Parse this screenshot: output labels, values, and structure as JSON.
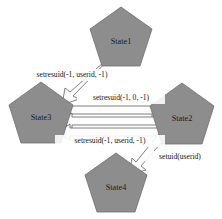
{
  "diagram": {
    "type": "state-machine",
    "canvas": {
      "width": 222,
      "height": 219
    },
    "colors": {
      "node_fill": "#8d8d8d",
      "node_stroke": "#6f6f6f",
      "arrow_fill": "#fdfdfd",
      "arrow_stroke": "#5e5e5e",
      "label_text": "#121212",
      "background": "#ffffff"
    },
    "nodes": [
      {
        "id": "state1",
        "label": "State1",
        "shape": "pentagon",
        "cx": 121,
        "cy": 40,
        "r": 33
      },
      {
        "id": "state3",
        "label": "State3",
        "shape": "pentagon",
        "cx": 41,
        "cy": 116,
        "r": 34
      },
      {
        "id": "state2",
        "label": "State2",
        "shape": "pentagon",
        "cx": 182,
        "cy": 117,
        "r": 34
      },
      {
        "id": "state4",
        "label": "State4",
        "shape": "pentagon",
        "cx": 116,
        "cy": 186,
        "r": 33
      }
    ],
    "edges": [
      {
        "id": "e1",
        "from": "state1",
        "to": "state3",
        "label": "setresuid(-1, userid, -1)",
        "label_x": 72,
        "label_y": 75
      },
      {
        "id": "e2",
        "from": "state3",
        "to": "state2",
        "label": "setresuid(-1, 0, -1)",
        "label_x": 121,
        "label_y": 98
      },
      {
        "id": "e3",
        "from": "state2",
        "to": "state3",
        "label": "",
        "label_x": 0,
        "label_y": 0
      },
      {
        "id": "e4",
        "from": "state2",
        "to": "state3",
        "label": "setresuid(-1, userid, -1)",
        "label_x": 110,
        "label_y": 141
      },
      {
        "id": "e5",
        "from": "state2",
        "to": "state4",
        "label": "setuid(userid)",
        "label_x": 180,
        "label_y": 157
      }
    ]
  }
}
